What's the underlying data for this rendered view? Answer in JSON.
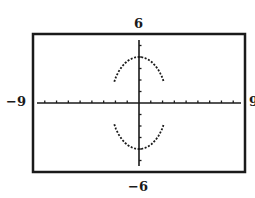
{
  "chart_data": {
    "type": "line",
    "title": "",
    "xlabel": "",
    "ylabel": "",
    "xlim": [
      -9,
      9
    ],
    "ylim": [
      -6,
      6
    ],
    "xscale_tick": 1,
    "yscale_tick": 1,
    "grid": false,
    "legend": null,
    "window_labels": {
      "xmin": "−9",
      "xmax": "9",
      "ymin": "−6",
      "ymax": "6"
    },
    "series": [
      {
        "name": "upper arc",
        "style": "dotted",
        "equation": "y = 4*sqrt(1 - x^2/5.6)",
        "x_range": [
          -2.1,
          2.1
        ],
        "vertex": [
          0,
          4
        ],
        "endpoints": [
          [
            -2.1,
            1.45
          ],
          [
            2.1,
            1.45
          ]
        ]
      },
      {
        "name": "lower arc",
        "style": "dotted",
        "equation": "y = -4*sqrt(1 - x^2/5.6)",
        "x_range": [
          -2.1,
          2.1
        ],
        "vertex": [
          0,
          -4
        ],
        "endpoints": [
          [
            -2.1,
            -1.45
          ],
          [
            2.1,
            -1.45
          ]
        ]
      }
    ]
  },
  "colors": {
    "ink": "#1a1a1a",
    "background": "#ffffff"
  }
}
